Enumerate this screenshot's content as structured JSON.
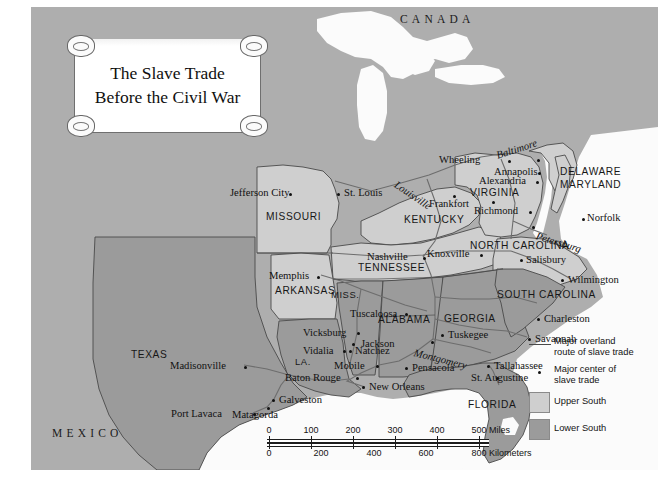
{
  "title": {
    "line1": "The Slave Trade",
    "line2": "Before the Civil War"
  },
  "countries": [
    {
      "name": "CANADA",
      "x": 400,
      "y": 6
    },
    {
      "name": "MEXICO",
      "x": 52,
      "y": 420
    }
  ],
  "states": [
    {
      "name": "MISSOURI",
      "x": 266,
      "y": 205
    },
    {
      "name": "KENTUCKY",
      "x": 404,
      "y": 208
    },
    {
      "name": "VIRGINIA",
      "x": 470,
      "y": 190
    },
    {
      "name": "DELAWARE",
      "x": 560,
      "y": 168
    },
    {
      "name": "MARYLAND",
      "x": 560,
      "y": 180
    },
    {
      "name": "TENNESSEE",
      "x": 358,
      "y": 263
    },
    {
      "name": "NORTH CAROLINA",
      "x": 470,
      "y": 241
    },
    {
      "name": "SOUTH CAROLINA",
      "x": 497,
      "y": 290
    },
    {
      "name": "ARKANSAS",
      "x": 275,
      "y": 286
    },
    {
      "name": "MISS.",
      "x": 331,
      "y": 290
    },
    {
      "name": "ALABAMA",
      "x": 378,
      "y": 315
    },
    {
      "name": "GEORGIA",
      "x": 444,
      "y": 314
    },
    {
      "name": "LA.",
      "x": 295,
      "y": 357
    },
    {
      "name": "TEXAS",
      "x": 131,
      "y": 350
    },
    {
      "name": "FLORIDA",
      "x": 468,
      "y": 400
    }
  ],
  "cities": [
    {
      "name": "Jefferson City",
      "x": 258,
      "y": 186,
      "dx": 52,
      "dy": 10,
      "italic": false
    },
    {
      "name": "St. Louis",
      "x": 306,
      "y": 186,
      "dx": -8,
      "dy": 10,
      "italic": false
    },
    {
      "name": "Louisville",
      "x": 368,
      "y": 172,
      "dx": 52,
      "dy": 22,
      "italic": true,
      "rot": 34
    },
    {
      "name": "Frankfort",
      "x": 406,
      "y": 197,
      "dx": -8,
      "dy": 3,
      "italic": false
    },
    {
      "name": "Nashville",
      "x": 337,
      "y": 249,
      "dx": 51,
      "dy": 4,
      "italic": false
    },
    {
      "name": "Knoxville",
      "x": 394,
      "y": 246,
      "dx": 51,
      "dy": 3,
      "italic": false
    },
    {
      "name": "Memphis",
      "x": 286,
      "y": 268,
      "dx": 47,
      "dy": 4,
      "italic": false
    },
    {
      "name": "Wheeling",
      "x": 440,
      "y": 152,
      "dx": 48,
      "dy": 4,
      "italic": false
    },
    {
      "name": "Baltimore",
      "x": 508,
      "y": 139,
      "dx": 46,
      "dy": 10,
      "italic": true,
      "rot": -18
    },
    {
      "name": "Annapolis",
      "x": 505,
      "y": 164,
      "dx": 42,
      "dy": 3,
      "italic": false
    },
    {
      "name": "Alexandria",
      "x": 497,
      "y": 173,
      "dx": 48,
      "dy": 3,
      "italic": false
    },
    {
      "name": "Richmond",
      "x": 481,
      "y": 203,
      "dx": 47,
      "dy": 3,
      "italic": false
    },
    {
      "name": "Petersburg",
      "x": 503,
      "y": 220,
      "dx": 4,
      "dy": 8,
      "italic": true,
      "rot": 17
    },
    {
      "name": "Norfolk",
      "x": 559,
      "y": 210,
      "dx": -7,
      "dy": 3,
      "italic": false
    },
    {
      "name": "Salisbury",
      "x": 491,
      "y": 252,
      "dx": 6,
      "dy": 2,
      "italic": false
    },
    {
      "name": "Wilmington",
      "x": 532,
      "y": 272,
      "dx": 6,
      "dy": 2,
      "italic": false
    },
    {
      "name": "Charleston",
      "x": 508,
      "y": 311,
      "dx": 6,
      "dy": 2,
      "italic": false
    },
    {
      "name": "Savannah",
      "x": 499,
      "y": 331,
      "dx": 6,
      "dy": 2,
      "italic": false
    },
    {
      "name": "Tuscaloosa",
      "x": 374,
      "y": 306,
      "dx": -58,
      "dy": 2,
      "italic": false
    },
    {
      "name": "Vicksburg",
      "x": 326,
      "y": 325,
      "dx": -52,
      "dy": 2,
      "italic": false
    },
    {
      "name": "Jackson",
      "x": 325,
      "y": 336,
      "dx": 6,
      "dy": 2,
      "italic": false
    },
    {
      "name": "Vidalia",
      "x": 312,
      "y": 343,
      "dx": -40,
      "dy": 2,
      "italic": false
    },
    {
      "name": "Natchez",
      "x": 320,
      "y": 343,
      "dx": 6,
      "dy": 2,
      "italic": false
    },
    {
      "name": "Montgomery",
      "x": 400,
      "y": 334,
      "dx": -16,
      "dy": 9,
      "italic": true,
      "rot": 14
    },
    {
      "name": "Tuskegee",
      "x": 412,
      "y": 327,
      "dx": 6,
      "dy": 2,
      "italic": false
    },
    {
      "name": "Mobile",
      "x": 345,
      "y": 358,
      "dx": -42,
      "dy": 2,
      "italic": false
    },
    {
      "name": "Pensacola",
      "x": 376,
      "y": 360,
      "dx": 6,
      "dy": 2,
      "italic": false
    },
    {
      "name": "Tallahassee",
      "x": 458,
      "y": 358,
      "dx": 6,
      "dy": 2,
      "italic": false
    },
    {
      "name": "Baton Rouge",
      "x": 325,
      "y": 370,
      "dx": -70,
      "dy": 2,
      "italic": false
    },
    {
      "name": "New Orleans",
      "x": 333,
      "y": 379,
      "dx": 6,
      "dy": 2,
      "italic": false
    },
    {
      "name": "St. Augustine",
      "x": 467,
      "y": 377,
      "dx": 6,
      "dy": 2,
      "italic": false
    },
    {
      "name": "Madisonville",
      "x": 213,
      "y": 358,
      "dx": -74,
      "dy": 2,
      "italic": false
    },
    {
      "name": "Galveston",
      "x": 243,
      "y": 392,
      "dx": 6,
      "dy": 2,
      "italic": false
    },
    {
      "name": "Port Lavaca",
      "x": 222,
      "y": 406,
      "dx": -69,
      "dy": 2,
      "italic": false
    },
    {
      "name": "Matagorda",
      "x": 236,
      "y": 400,
      "dx": -4,
      "dy": 10,
      "italic": false
    }
  ],
  "legend": {
    "items": [
      {
        "key": "line",
        "label_line1": "Major overland",
        "label_line2": "route of slave trade"
      },
      {
        "key": "dot",
        "label_line1": "Major center of",
        "label_line2": "slave trade"
      },
      {
        "key": "swatch-upper",
        "label_line1": "Upper South",
        "label_line2": ""
      },
      {
        "key": "swatch-lower",
        "label_line1": "Lower South",
        "label_line2": ""
      }
    ]
  },
  "scale": {
    "miles": {
      "ticks": [
        "0",
        "100",
        "200",
        "300",
        "400",
        "500"
      ],
      "unit": "Miles"
    },
    "kilometers": {
      "ticks": [
        "0",
        "200",
        "400",
        "600",
        "800"
      ],
      "unit": "Kilometers"
    }
  },
  "colors": {
    "background_land": "#aeaeae",
    "water": "#fbfbfb",
    "upper_south": "#cfcfcf",
    "lower_south": "#9b9b9b",
    "route_line": "#6d6d6d",
    "border_line": "#3a3a3a"
  }
}
